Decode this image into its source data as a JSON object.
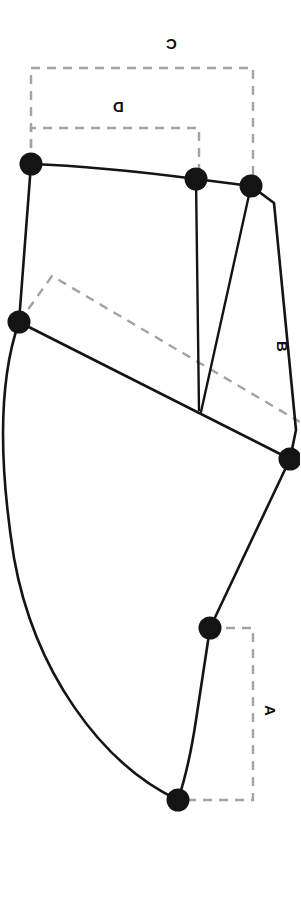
{
  "figure": {
    "canvas": {
      "width": 300,
      "height": 897
    },
    "background_color": "#ffffff",
    "outline_color": "#141414",
    "dimension_color": "#a3a3a3",
    "node_color": "#141414"
  },
  "labels": {
    "a": "A",
    "b": "B",
    "c": "C",
    "d": "D"
  },
  "label_rotations": {
    "a": "90",
    "b": "90",
    "c": "180",
    "d": "180"
  },
  "nodes": [
    {
      "id": "n1",
      "label": "node-top-left",
      "x": 31,
      "y": 164
    },
    {
      "id": "n2",
      "label": "node-top-mid",
      "x": 196,
      "y": 179
    },
    {
      "id": "n3",
      "label": "node-top-right",
      "x": 251,
      "y": 186
    },
    {
      "id": "n4",
      "label": "node-left-mid",
      "x": 19,
      "y": 322
    },
    {
      "id": "n5",
      "label": "node-right-mid",
      "x": 290,
      "y": 459
    },
    {
      "id": "n6",
      "label": "node-lower-right",
      "x": 210,
      "y": 628
    },
    {
      "id": "n7",
      "label": "node-bottom",
      "x": 178,
      "y": 800
    }
  ],
  "dimensions": [
    {
      "id": "a",
      "label": "A",
      "orientation": "vertical",
      "from_node": "n6",
      "to_node": "n7"
    },
    {
      "id": "b",
      "label": "B",
      "orientation": "diagonal",
      "from_node": "n4",
      "to_node": "n5"
    },
    {
      "id": "c",
      "label": "C",
      "orientation": "horizontal",
      "from_node": "n1",
      "to_node": "n3"
    },
    {
      "id": "d",
      "label": "D",
      "orientation": "horizontal",
      "from_node": "n1",
      "to_node": "n2"
    }
  ]
}
